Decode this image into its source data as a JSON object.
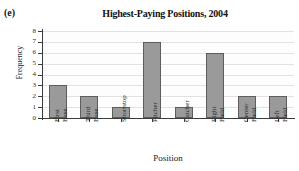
{
  "panel": {
    "label": "(e)"
  },
  "chart_data": {
    "type": "bar",
    "title": "Highest-Paying Positions, 2004",
    "xlabel": "Position",
    "ylabel": "Frequency",
    "categories": [
      "First Base",
      "Third Base",
      "Shortstop",
      "Pitcher",
      "Catcher",
      "Right Field",
      "Center Field",
      "Left Field"
    ],
    "category_lines": [
      [
        "First",
        "Base"
      ],
      [
        "Third",
        "Base"
      ],
      [
        "Shortstop"
      ],
      [
        "Pitcher"
      ],
      [
        "Catcher"
      ],
      [
        "Right",
        "Field"
      ],
      [
        "Center",
        "Field"
      ],
      [
        "Left",
        "Field"
      ]
    ],
    "values": [
      3,
      2,
      1,
      7,
      1,
      6,
      2,
      2
    ],
    "ylim": [
      0,
      8
    ],
    "ytick_labels": [
      "8",
      "7",
      "6",
      "5",
      "4",
      "3",
      "2",
      "1",
      "0"
    ],
    "ytick_values": [
      8,
      7,
      6,
      5,
      4,
      3,
      2,
      1,
      0
    ],
    "grid": true,
    "legend": false,
    "bar_color": "#9a9a9a",
    "bar_edge_color": "#5d5d5d",
    "axis_color": "#3c3c3c",
    "grid_color": "#e2e2e2",
    "background": "#ffffff"
  }
}
